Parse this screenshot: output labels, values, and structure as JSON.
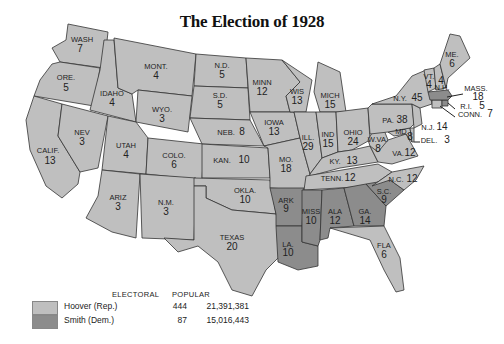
{
  "title": "The Election of 1928",
  "colors": {
    "hoover": "#bfbfbf",
    "smith": "#8c8c8c",
    "water": "#ffffff",
    "border": "#333333"
  },
  "legend": {
    "header_electoral": "ELECTORAL",
    "header_popular": "POPULAR",
    "rows": [
      {
        "name": "Hoover (Rep.)",
        "electoral": "444",
        "popular": "21,391,381",
        "color": "#bfbfbf"
      },
      {
        "name": "Smith (Dem.)",
        "electoral": "87",
        "popular": "15,016,443",
        "color": "#8c8c8c"
      }
    ]
  },
  "states": [
    {
      "abbr": "WASH",
      "votes": "7",
      "winner": "Hoover"
    },
    {
      "abbr": "ORE.",
      "votes": "5",
      "winner": "Hoover"
    },
    {
      "abbr": "CALIF.",
      "votes": "13",
      "winner": "Hoover"
    },
    {
      "abbr": "IDAHO",
      "votes": "4",
      "winner": "Hoover"
    },
    {
      "abbr": "NEV",
      "votes": "3",
      "winner": "Hoover"
    },
    {
      "abbr": "MONT.",
      "votes": "4",
      "winner": "Hoover"
    },
    {
      "abbr": "WYO.",
      "votes": "3",
      "winner": "Hoover"
    },
    {
      "abbr": "UTAH",
      "votes": "4",
      "winner": "Hoover"
    },
    {
      "abbr": "COLO.",
      "votes": "6",
      "winner": "Hoover"
    },
    {
      "abbr": "ARIZ",
      "votes": "3",
      "winner": "Hoover"
    },
    {
      "abbr": "N.M.",
      "votes": "3",
      "winner": "Hoover"
    },
    {
      "abbr": "N.D.",
      "votes": "5",
      "winner": "Hoover"
    },
    {
      "abbr": "S.D.",
      "votes": "5",
      "winner": "Hoover"
    },
    {
      "abbr": "NEB.",
      "votes": "8",
      "winner": "Hoover"
    },
    {
      "abbr": "KAN.",
      "votes": "10",
      "winner": "Hoover"
    },
    {
      "abbr": "OKLA.",
      "votes": "10",
      "winner": "Hoover"
    },
    {
      "abbr": "TEXAS",
      "votes": "20",
      "winner": "Hoover"
    },
    {
      "abbr": "MINN",
      "votes": "12",
      "winner": "Hoover"
    },
    {
      "abbr": "IOWA",
      "votes": "13",
      "winner": "Hoover"
    },
    {
      "abbr": "MO.",
      "votes": "18",
      "winner": "Hoover"
    },
    {
      "abbr": "ARK",
      "votes": "9",
      "winner": "Smith"
    },
    {
      "abbr": "LA.",
      "votes": "10",
      "winner": "Smith"
    },
    {
      "abbr": "WIS",
      "votes": "13",
      "winner": "Hoover"
    },
    {
      "abbr": "ILL.",
      "votes": "29",
      "winner": "Hoover"
    },
    {
      "abbr": "MICH",
      "votes": "15",
      "winner": "Hoover"
    },
    {
      "abbr": "IND",
      "votes": "15",
      "winner": "Hoover"
    },
    {
      "abbr": "OHIO",
      "votes": "24",
      "winner": "Hoover"
    },
    {
      "abbr": "KY.",
      "votes": "13",
      "winner": "Hoover"
    },
    {
      "abbr": "TENN.",
      "votes": "12",
      "winner": "Hoover"
    },
    {
      "abbr": "MISS",
      "votes": "10",
      "winner": "Smith"
    },
    {
      "abbr": "ALA",
      "votes": "12",
      "winner": "Smith"
    },
    {
      "abbr": "GA.",
      "votes": "14",
      "winner": "Smith"
    },
    {
      "abbr": "FLA",
      "votes": "6",
      "winner": "Hoover"
    },
    {
      "abbr": "S.C.",
      "votes": "9",
      "winner": "Smith"
    },
    {
      "abbr": "N.C.",
      "votes": "12",
      "winner": "Hoover"
    },
    {
      "abbr": "VA.",
      "votes": "12",
      "winner": "Hoover"
    },
    {
      "abbr": "W.VA.",
      "votes": "8",
      "winner": "Hoover"
    },
    {
      "abbr": "MD.",
      "votes": "8",
      "winner": "Hoover"
    },
    {
      "abbr": "DEL.",
      "votes": "3",
      "winner": "Hoover"
    },
    {
      "abbr": "PA.",
      "votes": "38",
      "winner": "Hoover"
    },
    {
      "abbr": "N.J.",
      "votes": "14",
      "winner": "Hoover"
    },
    {
      "abbr": "N.Y.",
      "votes": "45",
      "winner": "Hoover"
    },
    {
      "abbr": "CONN.",
      "votes": "7",
      "winner": "Hoover"
    },
    {
      "abbr": "R.I.",
      "votes": "5",
      "winner": "Smith"
    },
    {
      "abbr": "MASS.",
      "votes": "18",
      "winner": "Smith"
    },
    {
      "abbr": "VT.",
      "votes": "4",
      "winner": "Hoover"
    },
    {
      "abbr": "N.H.",
      "votes": "4",
      "winner": "Hoover"
    },
    {
      "abbr": "ME.",
      "votes": "6",
      "winner": "Hoover"
    }
  ]
}
